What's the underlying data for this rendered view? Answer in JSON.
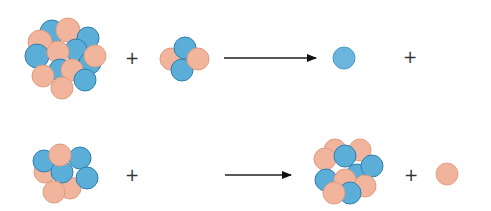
{
  "legend": {
    "proton_color": "#f0b59c",
    "proton_stroke": "#e39a7e",
    "neutron_color": "#5aaed8",
    "neutron_stroke": "#2f7fae"
  },
  "reactions": [
    {
      "name": "reaction-1",
      "reactants": [
        "large nucleus",
        "helium-4 nucleus (2 protons, 2 neutrons)"
      ],
      "products": [
        "neutron",
        ""
      ],
      "operators": [
        "+",
        "+"
      ]
    },
    {
      "name": "reaction-2",
      "reactants": [
        "nucleus",
        ""
      ],
      "products": [
        "nucleus",
        "proton"
      ],
      "operators": [
        "+",
        "+"
      ]
    }
  ],
  "symbols": {
    "plus": "+"
  }
}
